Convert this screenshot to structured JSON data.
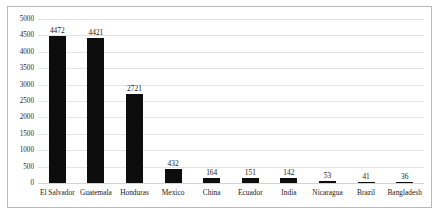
{
  "chart_data": {
    "type": "bar",
    "title": "",
    "subtitle": "",
    "xlabel": "",
    "ylabel": "",
    "categories": [
      "El Salvador",
      "Guatemala",
      "Honduras",
      "Mexico",
      "China",
      "Ecuador",
      "India",
      "Nicaragua",
      "Brazil",
      "Bangladesh"
    ],
    "values": [
      4472,
      4421,
      2721,
      432,
      164,
      151,
      142,
      53,
      41,
      36
    ],
    "data_labels": [
      "4472",
      "4421",
      "2721",
      "432",
      "164",
      "151",
      "142",
      "53",
      "41",
      "36"
    ],
    "ylim": [
      0,
      5000
    ],
    "ytick_values": [
      0,
      500,
      1000,
      1500,
      2000,
      2500,
      3000,
      3500,
      4000,
      4500,
      5000
    ],
    "ytick_labels": [
      "0",
      "500",
      "1000",
      "1500",
      "2000",
      "2500",
      "3000",
      "3500",
      "4000",
      "4500",
      "5000"
    ],
    "grid": "horizontal",
    "legend": "none",
    "bar_color": "#0d0d0d",
    "gridline_color": "#e4e4e4",
    "frame_color": "#b9b9b9",
    "background_color": "#ffffff",
    "label_color": "#1a1a1a"
  }
}
